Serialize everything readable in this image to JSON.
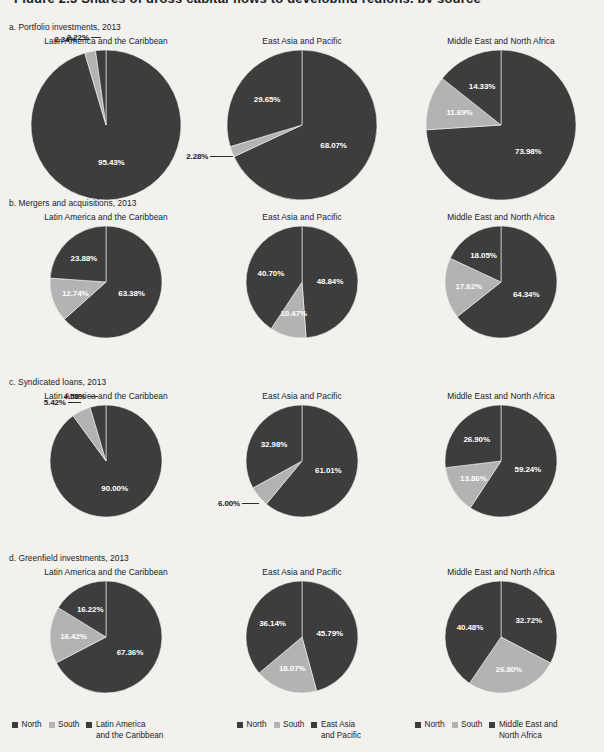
{
  "figure": {
    "clipped_title": "Figure 2.3 Shares of gross capital flows to developing regions, by source",
    "background": "#f2f1ee",
    "colors": {
      "north": "#3d3d3d",
      "south": "#b3b3b3",
      "region": "#3d3d3d",
      "label_inside": "#ffffff",
      "label_outside": "#1b1b1b"
    },
    "columns": [
      "Latin America and the Caribbean",
      "East Asia and Pacific",
      "Middle East and North Africa"
    ],
    "panels": [
      {
        "label": "a. Portfolio investments, 2013"
      },
      {
        "label": "b. Mergers and acquisitions, 2013"
      },
      {
        "label": "c. Syndicated loans, 2013"
      },
      {
        "label": "d. Greenfield investments, 2013"
      }
    ],
    "legends": [
      {
        "items": [
          {
            "label": "North",
            "color": "#3d3d3d"
          },
          {
            "label": "South",
            "color": "#b3b3b3"
          },
          {
            "label": "Latin America\nand the Caribbean",
            "color": "#3d3d3d"
          }
        ]
      },
      {
        "items": [
          {
            "label": "North",
            "color": "#3d3d3d"
          },
          {
            "label": "South",
            "color": "#b3b3b3"
          },
          {
            "label": "East Asia\nand Pacific",
            "color": "#3d3d3d"
          }
        ]
      },
      {
        "items": [
          {
            "label": "North",
            "color": "#3d3d3d"
          },
          {
            "label": "South",
            "color": "#b3b3b3"
          },
          {
            "label": "Middle East and\nNorth Africa",
            "color": "#3d3d3d"
          }
        ]
      }
    ]
  },
  "chart_data": [
    {
      "type": "pie",
      "title": "a. Portfolio investments, 2013 — Latin America and the Caribbean",
      "panel": "a. Portfolio investments, 2013",
      "region": "Latin America and the Caribbean",
      "labels": [
        "North",
        "South",
        "Latin America and the Caribbean"
      ],
      "values": [
        95.43,
        2.34,
        2.22
      ],
      "value_labels": [
        "95.43%",
        "2.34%",
        "2.22%"
      ],
      "colors": [
        "#3d3d3d",
        "#b3b3b3",
        "#3d3d3d"
      ],
      "units": "percent"
    },
    {
      "type": "pie",
      "title": "a. Portfolio investments, 2013 — East Asia and Pacific",
      "panel": "a. Portfolio investments, 2013",
      "region": "East Asia and Pacific",
      "labels": [
        "North",
        "South",
        "East Asia and Pacific"
      ],
      "values": [
        68.07,
        2.28,
        29.65
      ],
      "value_labels": [
        "68.07%",
        "2.28%",
        "29.65%"
      ],
      "colors": [
        "#3d3d3d",
        "#b3b3b3",
        "#3d3d3d"
      ],
      "units": "percent"
    },
    {
      "type": "pie",
      "title": "a. Portfolio investments, 2013 — Middle East and North Africa",
      "panel": "a. Portfolio investments, 2013",
      "region": "Middle East and North Africa",
      "labels": [
        "North",
        "South",
        "Middle East and North Africa"
      ],
      "values": [
        73.98,
        11.69,
        14.33
      ],
      "value_labels": [
        "73.98%",
        "11.69%",
        "14.33%"
      ],
      "colors": [
        "#3d3d3d",
        "#b3b3b3",
        "#3d3d3d"
      ],
      "units": "percent"
    },
    {
      "type": "pie",
      "title": "b. Mergers and acquisitions, 2013 — Latin America and the Caribbean",
      "panel": "b. Mergers and acquisitions, 2013",
      "region": "Latin America and the Caribbean",
      "labels": [
        "North",
        "South",
        "Latin America and the Caribbean"
      ],
      "values": [
        63.38,
        12.74,
        23.88
      ],
      "value_labels": [
        "63.38%",
        "12.74%",
        "23.88%"
      ],
      "colors": [
        "#3d3d3d",
        "#b3b3b3",
        "#3d3d3d"
      ],
      "units": "percent"
    },
    {
      "type": "pie",
      "title": "b. Mergers and acquisitions, 2013 — East Asia and Pacific",
      "panel": "b. Mergers and acquisitions, 2013",
      "region": "East Asia and Pacific",
      "labels": [
        "North",
        "South",
        "East Asia and Pacific"
      ],
      "values": [
        48.84,
        10.47,
        40.7
      ],
      "value_labels": [
        "48.84%",
        "10.47%",
        "40.70%"
      ],
      "colors": [
        "#3d3d3d",
        "#b3b3b3",
        "#3d3d3d"
      ],
      "units": "percent"
    },
    {
      "type": "pie",
      "title": "b. Mergers and acquisitions, 2013 — Middle East and North Africa",
      "panel": "b. Mergers and acquisitions, 2013",
      "region": "Middle East and North Africa",
      "labels": [
        "North",
        "South",
        "Middle East and North Africa"
      ],
      "values": [
        64.34,
        17.62,
        18.05
      ],
      "value_labels": [
        "64.34%",
        "17.62%",
        "18.05%"
      ],
      "colors": [
        "#3d3d3d",
        "#b3b3b3",
        "#3d3d3d"
      ],
      "units": "percent"
    },
    {
      "type": "pie",
      "title": "c. Syndicated loans, 2013 — Latin America and the Caribbean",
      "panel": "c. Syndicated loans, 2013",
      "region": "Latin America and the Caribbean",
      "labels": [
        "North",
        "South",
        "Latin America and the Caribbean"
      ],
      "values": [
        90.0,
        5.42,
        4.58
      ],
      "value_labels": [
        "90.00%",
        "5.42%",
        "4.58%"
      ],
      "colors": [
        "#3d3d3d",
        "#b3b3b3",
        "#3d3d3d"
      ],
      "units": "percent"
    },
    {
      "type": "pie",
      "title": "c. Syndicated loans, 2013 — East Asia and Pacific",
      "panel": "c. Syndicated loans, 2013",
      "region": "East Asia and Pacific",
      "labels": [
        "North",
        "South",
        "East Asia and Pacific"
      ],
      "values": [
        61.01,
        6.0,
        32.98
      ],
      "value_labels": [
        "61.01%",
        "6.00%",
        "32.98%"
      ],
      "colors": [
        "#3d3d3d",
        "#b3b3b3",
        "#3d3d3d"
      ],
      "units": "percent"
    },
    {
      "type": "pie",
      "title": "c. Syndicated loans, 2013 — Middle East and North Africa",
      "panel": "c. Syndicated loans, 2013",
      "region": "Middle East and North Africa",
      "labels": [
        "North",
        "South",
        "Middle East and North Africa"
      ],
      "values": [
        59.24,
        13.86,
        26.9
      ],
      "value_labels": [
        "59.24%",
        "13.86%",
        "26.90%"
      ],
      "colors": [
        "#3d3d3d",
        "#b3b3b3",
        "#3d3d3d"
      ],
      "units": "percent"
    },
    {
      "type": "pie",
      "title": "d. Greenfield investments, 2013 — Latin America and the Caribbean",
      "panel": "d. Greenfield investments, 2013",
      "region": "Latin America and the Caribbean",
      "labels": [
        "North",
        "South",
        "Latin America and the Caribbean"
      ],
      "values": [
        67.36,
        16.42,
        16.22
      ],
      "value_labels": [
        "67.36%",
        "16.42%",
        "16.22%"
      ],
      "colors": [
        "#3d3d3d",
        "#b3b3b3",
        "#3d3d3d"
      ],
      "units": "percent"
    },
    {
      "type": "pie",
      "title": "d. Greenfield investments, 2013 — East Asia and Pacific",
      "panel": "d. Greenfield investments, 2013",
      "region": "East Asia and Pacific",
      "labels": [
        "North",
        "South",
        "East Asia and Pacific"
      ],
      "values": [
        45.79,
        18.07,
        36.14
      ],
      "value_labels": [
        "45.79%",
        "18.07%",
        "36.14%"
      ],
      "colors": [
        "#3d3d3d",
        "#b3b3b3",
        "#3d3d3d"
      ],
      "units": "percent"
    },
    {
      "type": "pie",
      "title": "d. Greenfield investments, 2013 — Middle East and North Africa",
      "panel": "d. Greenfield investments, 2013",
      "region": "Middle East and North Africa",
      "labels": [
        "North",
        "South",
        "Middle East and North Africa"
      ],
      "values": [
        32.72,
        26.8,
        40.48
      ],
      "value_labels": [
        "32.72%",
        "26.80%",
        "40.48%"
      ],
      "colors": [
        "#3d3d3d",
        "#b3b3b3",
        "#3d3d3d"
      ],
      "units": "percent"
    }
  ],
  "layout": {
    "panel_tops": [
      22,
      198,
      377,
      553
    ],
    "pie_radii": [
      75,
      56,
      56,
      56
    ],
    "label_placements": [
      [
        {
          "i": 0,
          "mode": "inside",
          "r": 0.46,
          "dx": 0,
          "dy": 0
        },
        {
          "i": 1,
          "mode": "outside",
          "x": 30,
          "y": 6,
          "leader": {
            "x": 56,
            "y": 10,
            "w": 26
          }
        },
        {
          "i": 2,
          "mode": "outside",
          "x": 110,
          "y": 4,
          "leader": {
            "x": 88,
            "y": 8,
            "w": 20
          }
        }
      ],
      [
        {
          "i": 0,
          "mode": "inside",
          "r": 0.55,
          "dx": 0,
          "dy": 0
        },
        {
          "i": 1,
          "mode": "outside",
          "x": 16,
          "y": 92,
          "leader": null
        },
        {
          "i": 2,
          "mode": "inside",
          "r": 0.52,
          "dx": 0,
          "dy": 0
        }
      ],
      [
        {
          "i": 0,
          "mode": "inside",
          "r": 0.52,
          "dx": 0,
          "dy": 0
        },
        {
          "i": 1,
          "mode": "inside",
          "r": 0.6,
          "dx": 0,
          "dy": 0
        },
        {
          "i": 2,
          "mode": "inside",
          "r": 0.55,
          "dx": 0,
          "dy": 0
        }
      ]
    ]
  }
}
